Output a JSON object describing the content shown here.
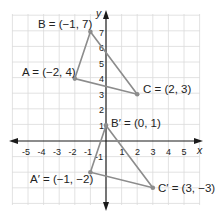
{
  "diagram": {
    "type": "coordinate-plane-translation",
    "axes": {
      "x_label": "x",
      "y_label": "y",
      "x_ticks": [
        "-5",
        "-4",
        "-3",
        "-2",
        "-1",
        "1",
        "2",
        "3",
        "4",
        "5"
      ],
      "y_ticks": [
        "1",
        "2",
        "3",
        "4",
        "5",
        "6",
        "7",
        "-1"
      ],
      "x_range": [
        -6,
        6
      ],
      "y_range": [
        -4,
        8
      ]
    },
    "colors": {
      "grid": "#d9d9d9",
      "axis": "#1a1a1a",
      "triangle": "#8c8c8c",
      "point": "#8c8c8c",
      "text": "#222222"
    },
    "original_triangle": {
      "points": [
        {
          "name": "A",
          "x": -2,
          "y": 4,
          "label": "A = (−2, 4)"
        },
        {
          "name": "B",
          "x": -1,
          "y": 7,
          "label": "B = (−1, 7)"
        },
        {
          "name": "C",
          "x": 2,
          "y": 3,
          "label": "C = (2, 3)"
        }
      ]
    },
    "image_triangle": {
      "points": [
        {
          "name": "A'",
          "x": -1,
          "y": -2,
          "label": "A′ = (−1, −2)"
        },
        {
          "name": "B'",
          "x": 0,
          "y": 1,
          "label": "B′ = (0, 1)"
        },
        {
          "name": "C'",
          "x": 3,
          "y": -3,
          "label": "C′ = (3, −3)"
        }
      ]
    }
  }
}
